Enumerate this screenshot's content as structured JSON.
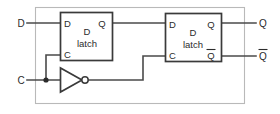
{
  "diagram": {
    "colors": {
      "wire": "#4a4a4a",
      "component_outline": "#3a3a3a",
      "boundary": "#b9b9b9",
      "background": "#ffffff",
      "text": "#2b2b2b"
    },
    "external_inputs": [
      {
        "label": "D",
        "name": "input-d"
      },
      {
        "label": "C",
        "name": "input-c"
      }
    ],
    "external_outputs": [
      {
        "label": "Q",
        "name": "output-q",
        "overbar": false
      },
      {
        "label": "Q",
        "name": "output-q-bar",
        "overbar": true
      }
    ],
    "components": [
      {
        "id": "master",
        "type": "d-latch",
        "title_line1": "D",
        "title_line2": "latch",
        "pins": {
          "d_in": "D",
          "c_in": "C",
          "q_out": "Q"
        }
      },
      {
        "id": "slave",
        "type": "d-latch",
        "title_line1": "D",
        "title_line2": "latch",
        "pins": {
          "d_in": "D",
          "c_in": "C",
          "q_out": "Q",
          "q_bar_out": "Q"
        }
      },
      {
        "id": "clock-inverter",
        "type": "inverter",
        "label": "NOT"
      }
    ],
    "nets": [
      {
        "name": "d-input-net",
        "from": "D",
        "to": "master.D"
      },
      {
        "name": "master-q-to-slave-d",
        "from": "master.Q",
        "to": "slave.D"
      },
      {
        "name": "c-to-inverter",
        "from": "C",
        "to": "clock-inverter.in"
      },
      {
        "name": "c-to-master-c",
        "from": "C",
        "to": "master.C"
      },
      {
        "name": "inverter-to-slave-c",
        "from": "clock-inverter.out",
        "to": "slave.C"
      },
      {
        "name": "slave-q-to-output",
        "from": "slave.Q",
        "to": "Q"
      },
      {
        "name": "slave-qbar-to-output",
        "from": "slave.Qbar",
        "to": "Qbar"
      }
    ]
  }
}
